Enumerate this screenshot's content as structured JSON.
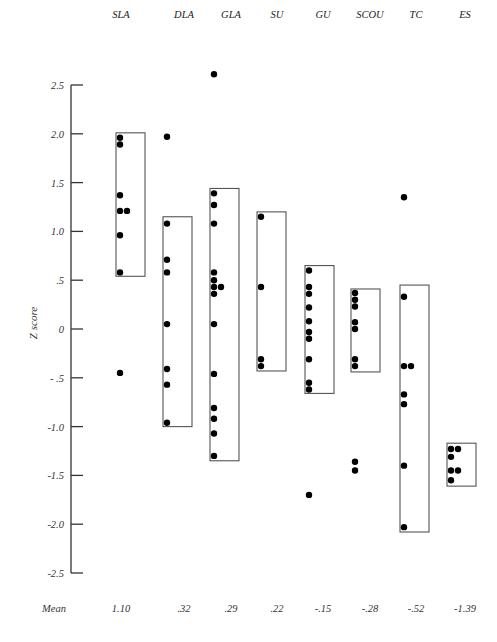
{
  "chart_data": {
    "type": "scatter",
    "title": "",
    "xlabel": "",
    "ylabel": "Z score",
    "ylim": [
      -2.5,
      2.5
    ],
    "grid": false,
    "legend": null,
    "y_ticks": [
      {
        "value": 2.5,
        "label": "2.5"
      },
      {
        "value": 2.0,
        "label": "2.0"
      },
      {
        "value": 1.5,
        "label": "1.5"
      },
      {
        "value": 1.0,
        "label": "1.0"
      },
      {
        "value": 0.5,
        "label": ".5"
      },
      {
        "value": 0,
        "label": "0"
      },
      {
        "value": -0.5,
        "label": "- .5"
      },
      {
        "value": -1.0,
        "label": "-1.0"
      },
      {
        "value": -1.5,
        "label": "-1.5"
      },
      {
        "value": -2.0,
        "label": "-2.0"
      },
      {
        "value": -2.5,
        "label": "-2.5"
      }
    ],
    "mean_row_label": "Mean",
    "groups": [
      {
        "name": "SLA",
        "mean_label": "1.10",
        "mean": 1.1,
        "box": [
          0.54,
          2.01
        ],
        "points": [
          1.96,
          1.89,
          1.37,
          1.21,
          1.21,
          0.96,
          0.58,
          -0.45
        ]
      },
      {
        "name": "DLA",
        "mean_label": ".32",
        "mean": 0.32,
        "box": [
          -1.0,
          1.15
        ],
        "points": [
          1.97,
          1.08,
          0.71,
          0.58,
          0.05,
          -0.41,
          -0.57,
          -0.96
        ]
      },
      {
        "name": "GLA",
        "mean_label": ".29",
        "mean": 0.29,
        "box": [
          -1.35,
          1.44
        ],
        "points": [
          2.61,
          1.39,
          1.27,
          1.08,
          0.58,
          0.5,
          0.43,
          0.43,
          0.36,
          0.05,
          -0.46,
          -0.81,
          -0.92,
          -1.07,
          -1.3
        ]
      },
      {
        "name": "SU",
        "mean_label": ".22",
        "mean": 0.22,
        "box": [
          -0.43,
          1.2
        ],
        "points": [
          1.15,
          0.43,
          -0.31,
          -0.38
        ]
      },
      {
        "name": "GU",
        "mean_label": "-.15",
        "mean": -0.15,
        "box": [
          -0.66,
          0.65
        ],
        "points": [
          0.6,
          0.43,
          0.36,
          0.22,
          0.08,
          -0.03,
          -0.1,
          -0.31,
          -0.55,
          -0.62,
          -1.7
        ]
      },
      {
        "name": "SCOU",
        "mean_label": "-.28",
        "mean": -0.28,
        "box": [
          -0.44,
          0.41
        ],
        "points": [
          0.37,
          0.3,
          0.23,
          0.07,
          0.0,
          -0.31,
          -0.38,
          -1.36,
          -1.45
        ]
      },
      {
        "name": "TC",
        "mean_label": "-.52",
        "mean": -0.52,
        "box": [
          -2.08,
          0.45
        ],
        "points": [
          1.35,
          0.33,
          -0.38,
          -0.38,
          -0.67,
          -0.77,
          -1.4,
          -2.03
        ]
      },
      {
        "name": "ES",
        "mean_label": "-1.39",
        "mean": -1.39,
        "box": [
          -1.61,
          -1.17
        ],
        "points": [
          -1.23,
          -1.23,
          -1.31,
          -1.45,
          -1.45,
          -1.55
        ]
      }
    ]
  }
}
